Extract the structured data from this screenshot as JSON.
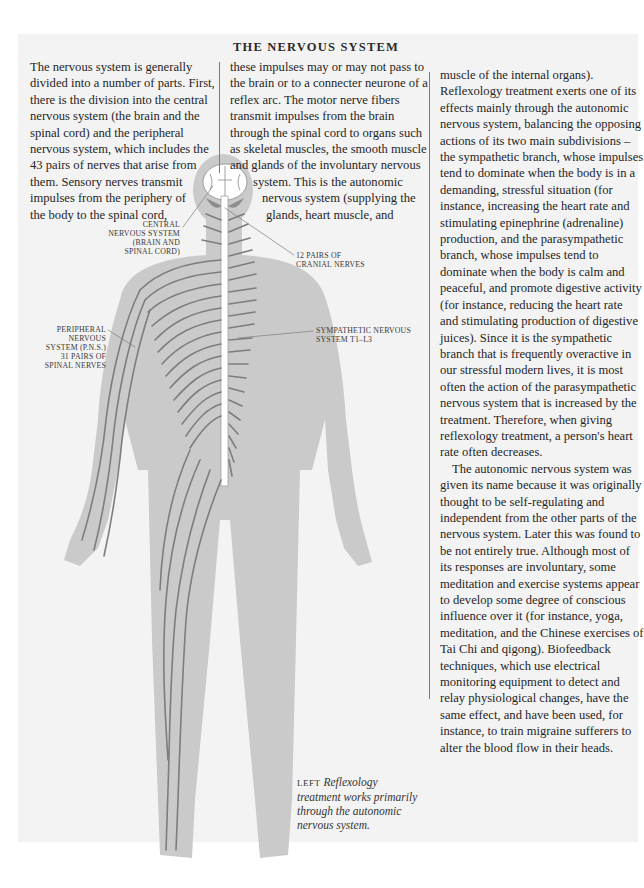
{
  "page": {
    "title": "THE NERVOUS SYSTEM",
    "colors": {
      "background": "#f3f3f3",
      "silhouette": "#c9c9c9",
      "nerves": "#7d7d7d",
      "text": "#262626"
    }
  },
  "columns": {
    "col1": {
      "lines": [
        "The nervous system is generally",
        "divided into a number of parts. First,",
        "there is the division into the central",
        "nervous system (the brain and the",
        "spinal cord) and the peripheral",
        "nervous system, which includes the",
        "43 pairs of nerves that arise from",
        "them. Sensory nerves transmit",
        "impulses from the periphery of",
        "the body to the spinal cord,"
      ]
    },
    "col2": {
      "lines": [
        "these impulses may or may not pass to",
        "the brain or to a connecter neurone of a",
        "reflex arc. The motor nerve fibers",
        "transmit impulses from the brain",
        "through the spinal cord to organs such",
        "as skeletal muscles, the smooth muscle",
        "and glands of the involuntary nervous",
        "system. This is the autonomic",
        "nervous system (supplying the",
        "glands, heart muscle, and"
      ]
    },
    "col3": {
      "lines": [
        "muscle of the internal organs).",
        "Reflexology treatment exerts one of its",
        "effects mainly through the autonomic",
        "nervous system, balancing the opposing",
        "actions of its two main subdivisions –",
        "the sympathetic branch, whose impulses",
        "tend to dominate when the body is in a",
        "demanding, stressful situation (for",
        "instance, increasing the heart rate and",
        "stimulating epinephrine (adrenaline)",
        "production, and the parasympathetic",
        "branch, whose impulses tend to",
        "dominate when the body is calm and",
        "peaceful, and promote digestive activity",
        "(for instance, reducing the heart rate",
        "and stimulating production of digestive",
        "juices). Since it is the sympathetic",
        "branch that is frequently overactive in",
        "our stressful modern lives, it is most",
        "often the action of the parasympathetic",
        "nervous system that is increased by the",
        "treatment. Therefore, when giving",
        "reflexology treatment, a person's heart",
        "rate often decreases.",
        "The autonomic nervous system was",
        "given its name because it was originally",
        "thought to be self-regulating and",
        "independent from the other parts of the",
        "nervous system. Later this was found to",
        "be not entirely true. Although most of",
        "its responses are involuntary, some",
        "meditation and exercise systems appear",
        "to develop some degree of conscious",
        "influence over it (for instance, yoga,",
        "meditation, and the Chinese exercises of",
        "Tai Chi and qigong). Biofeedback",
        "techniques, which use electrical",
        "monitoring equipment to detect and",
        "relay physiological changes, have the",
        "same effect, and have been used, for",
        "instance, to train migraine sufferers to",
        "alter the blood flow in their heads."
      ]
    }
  },
  "figure": {
    "labels": {
      "cns": [
        "CENTRAL",
        "NERVOUS SYSTEM",
        "(BRAIN AND",
        "SPINAL CORD)"
      ],
      "cranial": [
        "12 PAIRS OF",
        "CRANIAL NERVES"
      ],
      "pns": [
        "PERIPHERAL",
        "NERVOUS",
        "SYSTEM (P.N.S.)",
        "31 PAIRS OF",
        "SPINAL NERVES"
      ],
      "sympathetic": [
        "SYMPATHETIC NERVOUS",
        "SYSTEM T1–L3"
      ]
    },
    "caption": {
      "lead": "LEFT",
      "lines": [
        "Reflexology",
        "treatment works primarily",
        "through the autonomic",
        "nervous system."
      ]
    }
  }
}
